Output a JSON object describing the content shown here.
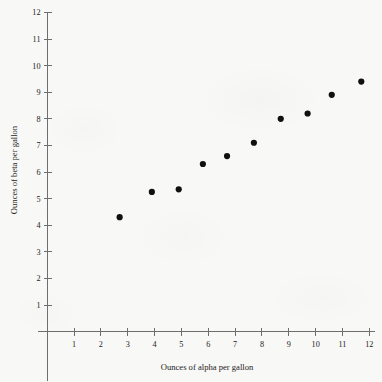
{
  "chart_data": {
    "type": "scatter",
    "title": "",
    "xlabel": "Ounces of alpha per gallon",
    "ylabel": "Ounces of beta per gallon",
    "xlim": [
      0,
      12.4
    ],
    "ylim": [
      0,
      12.3
    ],
    "xticks": [
      1,
      2,
      3,
      4,
      5,
      6,
      7,
      8,
      9,
      10,
      11,
      12
    ],
    "yticks": [
      1,
      2,
      3,
      4,
      5,
      6,
      7,
      8,
      9,
      10,
      11,
      12
    ],
    "xtick_labels": [
      "1",
      "2",
      "3",
      "4",
      "5",
      "6",
      "7",
      "8",
      "9",
      "10",
      "11",
      "12"
    ],
    "ytick_labels": [
      "1",
      "2",
      "3",
      "4",
      "5",
      "6",
      "7",
      "8",
      "9",
      "10",
      "11",
      "12"
    ],
    "grid": false,
    "legend": null,
    "marker": "filled-circle",
    "marker_color": "#101010",
    "axis_color": "#6e6e6e",
    "background_color": "#f8f8f6",
    "points": [
      {
        "x": 2.7,
        "y": 4.3
      },
      {
        "x": 3.9,
        "y": 5.25
      },
      {
        "x": 4.9,
        "y": 5.35
      },
      {
        "x": 5.8,
        "y": 6.3
      },
      {
        "x": 6.7,
        "y": 6.6
      },
      {
        "x": 7.7,
        "y": 7.1
      },
      {
        "x": 8.7,
        "y": 8.0
      },
      {
        "x": 9.7,
        "y": 8.2
      },
      {
        "x": 10.6,
        "y": 8.9
      },
      {
        "x": 11.7,
        "y": 9.4
      }
    ],
    "x": [
      2.7,
      3.9,
      4.9,
      5.8,
      6.7,
      7.7,
      8.7,
      9.7,
      10.6,
      11.7
    ],
    "values": [
      4.3,
      5.25,
      5.35,
      6.3,
      6.6,
      7.1,
      8.0,
      8.2,
      8.9,
      9.4
    ]
  },
  "axes": {
    "x_title": "Ounces of alpha per gallon",
    "y_title": "Ounces of beta per gallon"
  }
}
